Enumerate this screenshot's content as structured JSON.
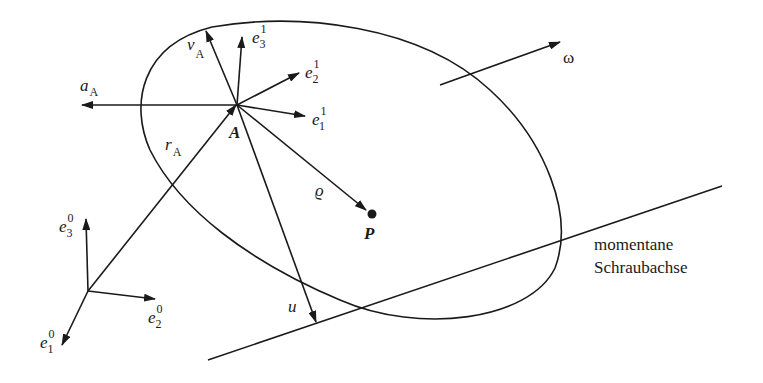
{
  "diagram": {
    "labels": {
      "a_A": {
        "base": "a",
        "sub": "A"
      },
      "v_A": {
        "base": "v",
        "sub": "A"
      },
      "e1_1": {
        "base": "e",
        "sup": "1",
        "sub": "1"
      },
      "e2_1": {
        "base": "e",
        "sup": "1",
        "sub": "2"
      },
      "e3_1": {
        "base": "e",
        "sup": "1",
        "sub": "3"
      },
      "e1_0": {
        "base": "e",
        "sup": "0",
        "sub": "1"
      },
      "e2_0": {
        "base": "e",
        "sup": "0",
        "sub": "2"
      },
      "e3_0": {
        "base": "e",
        "sup": "0",
        "sub": "3"
      },
      "r_A": {
        "base": "r",
        "sub": "A"
      },
      "A": "A",
      "P": "P",
      "rho": "ϱ",
      "u": "u",
      "omega": "ω"
    },
    "axis_caption": {
      "line1": "momentane",
      "line2": "Schraubachse"
    },
    "colors": {
      "stroke": "#1a1a1a",
      "background": "#ffffff"
    }
  }
}
